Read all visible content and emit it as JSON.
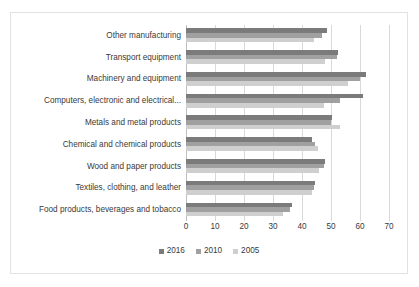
{
  "chart_data": {
    "type": "bar",
    "orientation": "horizontal",
    "title": "",
    "xlabel": "",
    "ylabel": "",
    "xlim": [
      0,
      70
    ],
    "xticks": [
      0,
      10,
      20,
      30,
      40,
      50,
      60,
      70
    ],
    "grid": true,
    "legend_position": "bottom",
    "categories": [
      "Other manufacturing",
      "Transport equipment",
      "Machinery and equipment",
      "Computers, electronic and electrical...",
      "Metals and metal products",
      "Chemical and chemical products",
      "Wood and paper products",
      "Textiles, clothing, and leather",
      "Food products, beverages and tobacco"
    ],
    "series": [
      {
        "name": "2016",
        "color": "#7b7b7b",
        "values": [
          48.5,
          52.5,
          62.0,
          61.0,
          50.5,
          43.5,
          48.0,
          44.5,
          36.5
        ]
      },
      {
        "name": "2010",
        "color": "#a0a0a0",
        "values": [
          47.0,
          52.0,
          60.0,
          53.0,
          50.0,
          44.5,
          47.5,
          44.0,
          36.0
        ]
      },
      {
        "name": "2005",
        "color": "#cfcfcf",
        "values": [
          44.0,
          48.0,
          56.0,
          47.5,
          53.0,
          45.5,
          46.0,
          43.5,
          33.5
        ]
      }
    ]
  }
}
